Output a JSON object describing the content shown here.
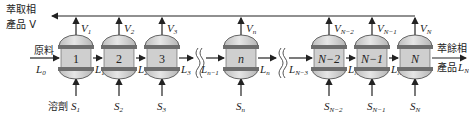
{
  "labels": {
    "extract_product_line1": "萃取相",
    "extract_product_line2": "產品 V",
    "feed": "原料",
    "feed_stream": "L",
    "feed_stream_sub": "0",
    "solvent": "溶劑",
    "raffinate_product_line1": "萃餘相",
    "raffinate_product_line2": "產品",
    "raffinate_stream": "L",
    "raffinate_stream_sub": "N"
  },
  "stages": [
    {
      "id": "1",
      "label": "1",
      "italic": false,
      "v": "V",
      "v_sub": "1",
      "s": "S",
      "s_sub": "1",
      "l_out": "L",
      "l_out_sub": "1"
    },
    {
      "id": "2",
      "label": "2",
      "italic": false,
      "v": "V",
      "v_sub": "2",
      "s": "S",
      "s_sub": "2",
      "l_out": "L",
      "l_out_sub": "2"
    },
    {
      "id": "3",
      "label": "3",
      "italic": false,
      "v": "V",
      "v_sub": "3",
      "s": "S",
      "s_sub": "3",
      "l_out": "L",
      "l_out_sub": "3"
    },
    {
      "id": "n",
      "label": "n",
      "italic": true,
      "v": "V",
      "v_sub": "n",
      "s": "S",
      "s_sub": "n",
      "l_in": "L",
      "l_in_sub": "n−1",
      "l_out": "L",
      "l_out_sub": "n"
    },
    {
      "id": "N-2",
      "label": "N−2",
      "italic": true,
      "v": "V",
      "v_sub": "N−2",
      "s": "S",
      "s_sub": "N−2",
      "l_in": "L",
      "l_in_sub": "N−3",
      "l_out": "L",
      "l_out_sub": "N−2"
    },
    {
      "id": "N-1",
      "label": "N−1",
      "italic": true,
      "v": "V",
      "v_sub": "N−1",
      "s": "S",
      "s_sub": "N−1",
      "l_out": "L",
      "l_out_sub": "N−1"
    },
    {
      "id": "N",
      "label": "N",
      "italic": true,
      "v": "V",
      "v_sub": "N",
      "s": "S",
      "s_sub": "N"
    }
  ],
  "colors": {
    "vessel_fill": "#d4d4d4",
    "vessel_body": "#c8c8c8",
    "band": "#6e6e6e",
    "line": "#222222"
  }
}
